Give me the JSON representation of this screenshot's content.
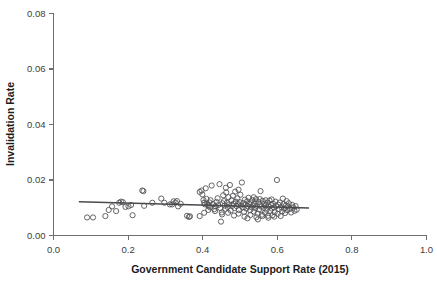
{
  "chart_data": {
    "type": "scatter",
    "title": "",
    "xlabel": "Government Candidate Support Rate (2015)",
    "ylabel": "Invalidation Rate",
    "xlim": [
      0.0,
      1.0
    ],
    "ylim": [
      0.0,
      0.08
    ],
    "xticks": [
      0.0,
      0.2,
      0.4,
      0.6,
      0.8,
      1.0
    ],
    "xtick_labels": [
      "0.0",
      "0.2",
      "0.4",
      "0.6",
      "0.8",
      "1.0"
    ],
    "yticks": [
      0.0,
      0.02,
      0.04,
      0.06,
      0.08
    ],
    "ytick_labels": [
      "0.00",
      "0.02",
      "0.04",
      "0.06",
      "0.08"
    ],
    "grid": false,
    "legend": null,
    "marker": "open-circle",
    "marker_color": "#555558",
    "marker_radius": 2.6,
    "fit_line": {
      "name": "linear fit",
      "color": "#4a4a4d",
      "x_start": 0.068,
      "y_start": 0.01215,
      "x_end": 0.685,
      "y_end": 0.00995
    },
    "points": [
      [
        0.09,
        0.0065
      ],
      [
        0.106,
        0.0065
      ],
      [
        0.139,
        0.007
      ],
      [
        0.148,
        0.0092
      ],
      [
        0.157,
        0.0105
      ],
      [
        0.168,
        0.0088
      ],
      [
        0.176,
        0.0118
      ],
      [
        0.181,
        0.0122
      ],
      [
        0.186,
        0.012
      ],
      [
        0.193,
        0.0103
      ],
      [
        0.201,
        0.0105
      ],
      [
        0.208,
        0.011
      ],
      [
        0.212,
        0.0073
      ],
      [
        0.238,
        0.0162
      ],
      [
        0.241,
        0.016
      ],
      [
        0.243,
        0.0107
      ],
      [
        0.265,
        0.0118
      ],
      [
        0.289,
        0.0133
      ],
      [
        0.297,
        0.0118
      ],
      [
        0.312,
        0.0112
      ],
      [
        0.318,
        0.0112
      ],
      [
        0.322,
        0.0123
      ],
      [
        0.327,
        0.0119
      ],
      [
        0.331,
        0.0124
      ],
      [
        0.334,
        0.0105
      ],
      [
        0.341,
        0.0114
      ],
      [
        0.358,
        0.0071
      ],
      [
        0.363,
        0.0067
      ],
      [
        0.366,
        0.0069
      ],
      [
        0.392,
        0.0157
      ],
      [
        0.397,
        0.0162
      ],
      [
        0.399,
        0.0148
      ],
      [
        0.402,
        0.0128
      ],
      [
        0.404,
        0.0118
      ],
      [
        0.406,
        0.0112
      ],
      [
        0.408,
        0.017
      ],
      [
        0.41,
        0.0132
      ],
      [
        0.412,
        0.0115
      ],
      [
        0.414,
        0.011
      ],
      [
        0.416,
        0.0106
      ],
      [
        0.418,
        0.0119
      ],
      [
        0.42,
        0.0101
      ],
      [
        0.421,
        0.0127
      ],
      [
        0.424,
        0.018
      ],
      [
        0.428,
        0.0113
      ],
      [
        0.431,
        0.0095
      ],
      [
        0.434,
        0.0105
      ],
      [
        0.437,
        0.0121
      ],
      [
        0.44,
        0.0134
      ],
      [
        0.442,
        0.011
      ],
      [
        0.445,
        0.0185
      ],
      [
        0.447,
        0.0099
      ],
      [
        0.449,
        0.005
      ],
      [
        0.451,
        0.0083
      ],
      [
        0.453,
        0.0116
      ],
      [
        0.455,
        0.0145
      ],
      [
        0.457,
        0.0124
      ],
      [
        0.459,
        0.0108
      ],
      [
        0.461,
        0.0096
      ],
      [
        0.463,
        0.0155
      ],
      [
        0.465,
        0.0118
      ],
      [
        0.467,
        0.0103
      ],
      [
        0.469,
        0.0138
      ],
      [
        0.471,
        0.0112
      ],
      [
        0.473,
        0.0182
      ],
      [
        0.475,
        0.009
      ],
      [
        0.477,
        0.0127
      ],
      [
        0.479,
        0.0107
      ],
      [
        0.481,
        0.0143
      ],
      [
        0.483,
        0.0115
      ],
      [
        0.485,
        0.0099
      ],
      [
        0.487,
        0.0158
      ],
      [
        0.489,
        0.0122
      ],
      [
        0.491,
        0.0106
      ],
      [
        0.493,
        0.0134
      ],
      [
        0.495,
        0.0113
      ],
      [
        0.497,
        0.0092
      ],
      [
        0.499,
        0.012
      ],
      [
        0.501,
        0.0147
      ],
      [
        0.503,
        0.0108
      ],
      [
        0.505,
        0.0191
      ],
      [
        0.507,
        0.0101
      ],
      [
        0.509,
        0.0117
      ],
      [
        0.511,
        0.0085
      ],
      [
        0.513,
        0.0129
      ],
      [
        0.515,
        0.0111
      ],
      [
        0.517,
        0.0097
      ],
      [
        0.519,
        0.0123
      ],
      [
        0.521,
        0.0105
      ],
      [
        0.523,
        0.0136
      ],
      [
        0.525,
        0.0114
      ],
      [
        0.527,
        0.0091
      ],
      [
        0.529,
        0.0119
      ],
      [
        0.531,
        0.0102
      ],
      [
        0.533,
        0.0128
      ],
      [
        0.535,
        0.0109
      ],
      [
        0.537,
        0.0086
      ],
      [
        0.539,
        0.0116
      ],
      [
        0.541,
        0.0098
      ],
      [
        0.543,
        0.0131
      ],
      [
        0.545,
        0.0107
      ],
      [
        0.547,
        0.0079
      ],
      [
        0.549,
        0.0121
      ],
      [
        0.551,
        0.0094
      ],
      [
        0.553,
        0.0112
      ],
      [
        0.555,
        0.016
      ],
      [
        0.557,
        0.0104
      ],
      [
        0.559,
        0.0075
      ],
      [
        0.561,
        0.0125
      ],
      [
        0.563,
        0.01
      ],
      [
        0.565,
        0.0115
      ],
      [
        0.567,
        0.0082
      ],
      [
        0.569,
        0.0108
      ],
      [
        0.571,
        0.0093
      ],
      [
        0.573,
        0.0118
      ],
      [
        0.575,
        0.0071
      ],
      [
        0.577,
        0.0103
      ],
      [
        0.579,
        0.0126
      ],
      [
        0.581,
        0.0089
      ],
      [
        0.583,
        0.011
      ],
      [
        0.585,
        0.0097
      ],
      [
        0.587,
        0.0073
      ],
      [
        0.589,
        0.0114
      ],
      [
        0.591,
        0.0101
      ],
      [
        0.593,
        0.0084
      ],
      [
        0.595,
        0.0122
      ],
      [
        0.597,
        0.0106
      ],
      [
        0.599,
        0.02
      ],
      [
        0.601,
        0.0078
      ],
      [
        0.603,
        0.0111
      ],
      [
        0.605,
        0.0095
      ],
      [
        0.607,
        0.0119
      ],
      [
        0.609,
        0.007
      ],
      [
        0.611,
        0.0102
      ],
      [
        0.613,
        0.0087
      ],
      [
        0.615,
        0.0133
      ],
      [
        0.617,
        0.0113
      ],
      [
        0.619,
        0.0098
      ],
      [
        0.621,
        0.0081
      ],
      [
        0.623,
        0.0108
      ],
      [
        0.625,
        0.0124
      ],
      [
        0.627,
        0.0091
      ],
      [
        0.629,
        0.0105
      ],
      [
        0.631,
        0.0116
      ],
      [
        0.634,
        0.0096
      ],
      [
        0.637,
        0.0083
      ],
      [
        0.64,
        0.011
      ],
      [
        0.643,
        0.0101
      ],
      [
        0.646,
        0.0089
      ],
      [
        0.649,
        0.0106
      ],
      [
        0.652,
        0.0093
      ],
      [
        0.415,
        0.0092
      ],
      [
        0.433,
        0.0088
      ],
      [
        0.452,
        0.0076
      ],
      [
        0.468,
        0.0082
      ],
      [
        0.484,
        0.0072
      ],
      [
        0.496,
        0.0079
      ],
      [
        0.512,
        0.0068
      ],
      [
        0.528,
        0.0074
      ],
      [
        0.544,
        0.0066
      ],
      [
        0.56,
        0.007
      ],
      [
        0.576,
        0.0064
      ],
      [
        0.592,
        0.0068
      ],
      [
        0.52,
        0.0062
      ],
      [
        0.548,
        0.0058
      ],
      [
        0.404,
        0.0082
      ],
      [
        0.392,
        0.007
      ],
      [
        0.537,
        0.0138
      ],
      [
        0.553,
        0.0131
      ],
      [
        0.569,
        0.0127
      ],
      [
        0.585,
        0.013
      ],
      [
        0.496,
        0.0165
      ],
      [
        0.462,
        0.0172
      ]
    ]
  }
}
